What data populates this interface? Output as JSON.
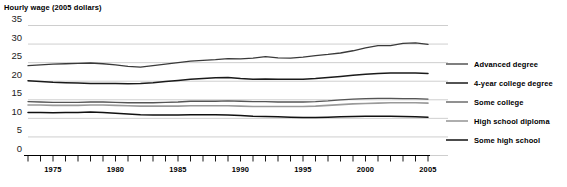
{
  "chart_data": {
    "type": "line",
    "title": "Hourly wage (2005 dollars)",
    "xlabel": "",
    "ylabel": "",
    "ylim": [
      0,
      35
    ],
    "xlim": [
      1973,
      2005
    ],
    "ytick_values": [
      0,
      5,
      10,
      15,
      20,
      25,
      30,
      35
    ],
    "ytick_labels": [
      "0",
      "5",
      "10",
      "15",
      "20",
      "25",
      "30",
      "35"
    ],
    "xtick_labels": [
      "1975",
      "1980",
      "1985",
      "1990",
      "1995",
      "2000",
      "2005"
    ],
    "xtick_label_values": [
      1975,
      1980,
      1985,
      1990,
      1995,
      2000,
      2005
    ],
    "x": [
      1973,
      1974,
      1975,
      1976,
      1977,
      1978,
      1979,
      1980,
      1981,
      1982,
      1983,
      1984,
      1985,
      1986,
      1987,
      1988,
      1989,
      1990,
      1991,
      1992,
      1993,
      1994,
      1995,
      1996,
      1997,
      1998,
      1999,
      2000,
      2001,
      2002,
      2003,
      2004,
      2005
    ],
    "grid": true,
    "grid_axis": "y",
    "legend_position": "right",
    "series": [
      {
        "name": "Advanced degree",
        "color": "#3a3a3a",
        "width": 1.3,
        "values": [
          24.2,
          24.4,
          24.6,
          24.7,
          24.8,
          24.9,
          24.7,
          24.4,
          24.0,
          23.8,
          24.2,
          24.6,
          25.0,
          25.4,
          25.6,
          25.8,
          26.1,
          26.0,
          26.2,
          26.6,
          26.3,
          26.2,
          26.5,
          26.9,
          27.2,
          27.6,
          28.2,
          29.0,
          29.6,
          29.6,
          30.2,
          30.3,
          29.9
        ]
      },
      {
        "name": "4-year college degree",
        "color": "#1a1a1a",
        "width": 1.5,
        "values": [
          20.1,
          19.9,
          19.7,
          19.6,
          19.5,
          19.4,
          19.4,
          19.4,
          19.3,
          19.4,
          19.6,
          19.9,
          20.2,
          20.5,
          20.7,
          20.9,
          21.0,
          20.7,
          20.5,
          20.6,
          20.5,
          20.5,
          20.5,
          20.7,
          21.0,
          21.3,
          21.6,
          21.9,
          22.1,
          22.2,
          22.2,
          22.2,
          22.1
        ]
      },
      {
        "name": "Some college",
        "color": "#555555",
        "width": 1.3,
        "values": [
          14.5,
          14.4,
          14.3,
          14.3,
          14.3,
          14.4,
          14.4,
          14.3,
          14.2,
          14.2,
          14.2,
          14.3,
          14.4,
          14.6,
          14.6,
          14.6,
          14.7,
          14.6,
          14.5,
          14.5,
          14.4,
          14.4,
          14.4,
          14.5,
          14.7,
          15.0,
          15.2,
          15.3,
          15.4,
          15.4,
          15.3,
          15.3,
          15.2
        ]
      },
      {
        "name": "High school diploma",
        "color": "#9a9a9a",
        "width": 1.6,
        "values": [
          13.6,
          13.6,
          13.5,
          13.5,
          13.5,
          13.6,
          13.6,
          13.5,
          13.4,
          13.3,
          13.3,
          13.3,
          13.3,
          13.4,
          13.4,
          13.4,
          13.4,
          13.3,
          13.2,
          13.2,
          13.2,
          13.2,
          13.2,
          13.3,
          13.5,
          13.7,
          13.9,
          14.0,
          14.1,
          14.2,
          14.2,
          14.2,
          14.1
        ]
      },
      {
        "name": "Some high school",
        "color": "#111111",
        "width": 1.5,
        "values": [
          11.6,
          11.6,
          11.5,
          11.6,
          11.6,
          11.7,
          11.6,
          11.4,
          11.2,
          11.0,
          10.9,
          10.9,
          10.9,
          11.0,
          11.0,
          11.0,
          10.9,
          10.8,
          10.6,
          10.5,
          10.4,
          10.3,
          10.2,
          10.2,
          10.3,
          10.4,
          10.5,
          10.6,
          10.6,
          10.6,
          10.5,
          10.4,
          10.3
        ]
      }
    ]
  },
  "colors": {
    "gridline": "#b9b9b9",
    "axis": "#000000",
    "text": "#000000",
    "background": "#ffffff"
  },
  "legend": {
    "items": [
      {
        "label": "Advanced degree"
      },
      {
        "label": "4-year college degree"
      },
      {
        "label": "Some college"
      },
      {
        "label": "High school diploma"
      },
      {
        "label": "Some high school"
      }
    ]
  }
}
